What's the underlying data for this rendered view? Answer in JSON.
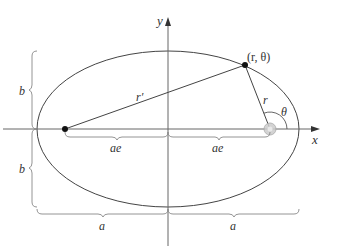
{
  "diagram": {
    "labels": {
      "y_axis": "y",
      "x_axis": "x",
      "point": "(r, θ)",
      "r_prime": "r′",
      "r": "r",
      "theta": "θ",
      "ae_left": "ae",
      "ae_right": "ae",
      "b_top": "b",
      "b_bottom": "b",
      "a_left": "a",
      "a_right": "a"
    },
    "colors": {
      "line": "#444444",
      "axis": "#666666",
      "brace": "#888888",
      "point": "#111111",
      "focus_glow": "#bbbbbb"
    }
  }
}
